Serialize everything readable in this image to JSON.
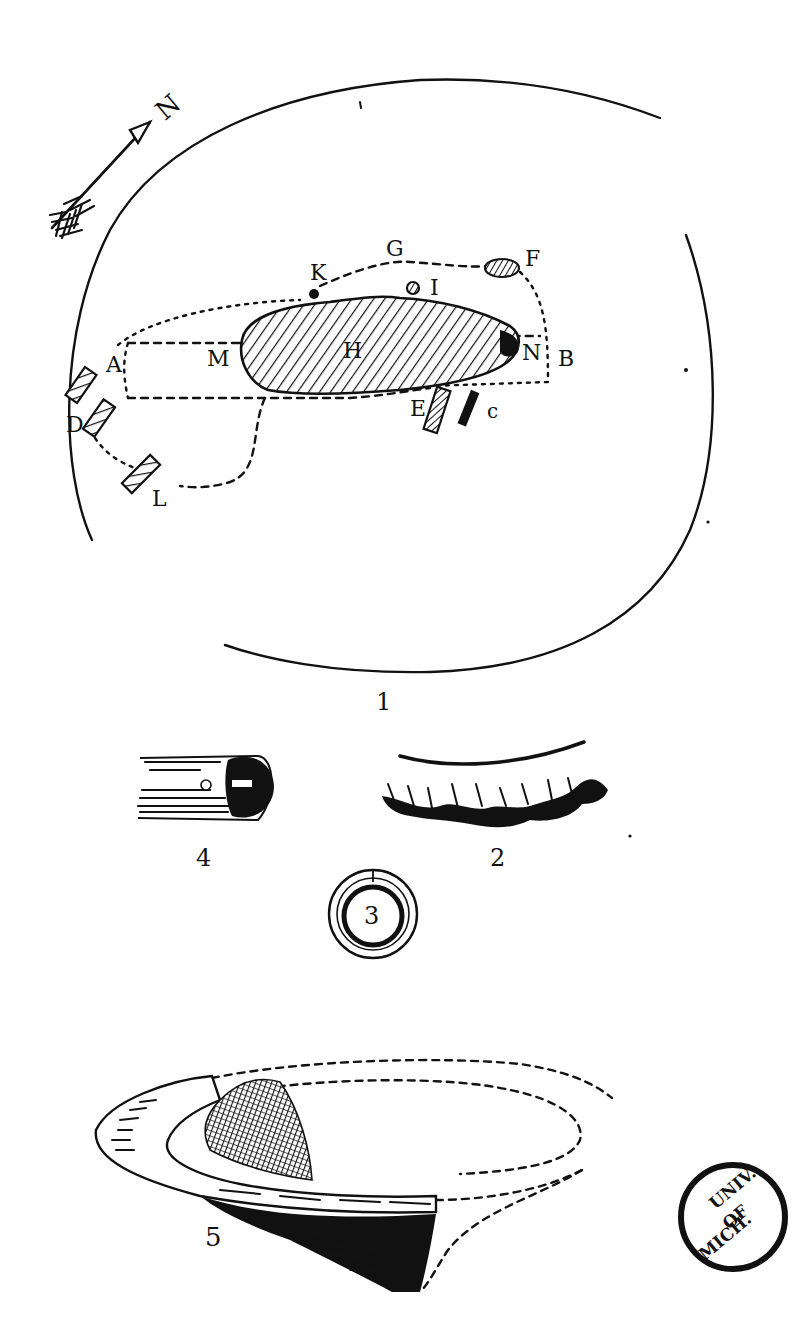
{
  "plate": {
    "figures": [
      {
        "number": "1",
        "subject": "site-plan"
      },
      {
        "number": "2",
        "subject": "fringed-fragment"
      },
      {
        "number": "3",
        "subject": "ring"
      },
      {
        "number": "4",
        "subject": "cylindrical-object"
      },
      {
        "number": "5",
        "subject": "vessel-fragment"
      }
    ]
  },
  "fig1": {
    "number": "1",
    "north_label": "N",
    "labels": {
      "A": "A",
      "B": "B",
      "C": "c",
      "D": "D",
      "E": "E",
      "F": "F",
      "G": "G",
      "H": "H",
      "I": "I",
      "K": "K",
      "L": "L",
      "M": "M",
      "N": "N"
    }
  },
  "fig2": {
    "number": "2"
  },
  "fig3": {
    "number": "3"
  },
  "fig4": {
    "number": "4"
  },
  "fig5": {
    "number": "5"
  },
  "stamp": {
    "line1": "UNIV.",
    "line2": "OF",
    "line3": "MICH."
  }
}
